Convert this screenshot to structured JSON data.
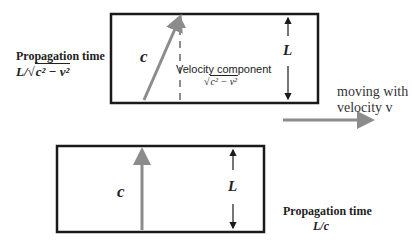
{
  "colors": {
    "box_stroke": "#1a1a1a",
    "arrow_gray": "#8c8c8c",
    "text": "#222222"
  },
  "moving_frame": {
    "propagation_label": "Propagation time",
    "propagation_formula_prefix": "L/√",
    "propagation_formula_radicand": "c² − v²",
    "light_vector_label": "c",
    "velocity_component_label": "Velocity component",
    "velocity_component_formula_prefix": "√",
    "velocity_component_formula_radicand": "c² − v²",
    "height_label": "L"
  },
  "motion": {
    "line1": "moving with",
    "line2": "velocity v"
  },
  "rest_frame": {
    "light_vector_label": "c",
    "height_label": "L",
    "propagation_label": "Propagation time",
    "propagation_formula": "L/c"
  }
}
